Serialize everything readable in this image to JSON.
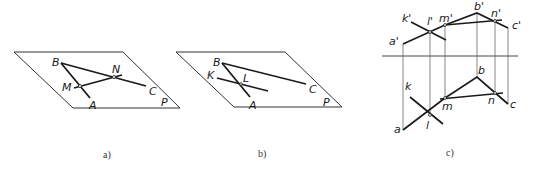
{
  "figures": {
    "a": {
      "caption": "a)",
      "plane_label": "P",
      "points": {
        "B": "B",
        "A": "A",
        "C": "C",
        "M": "M",
        "N": "N"
      }
    },
    "b": {
      "caption": "b)",
      "plane_label": "P",
      "points": {
        "B": "B",
        "A": "A",
        "C": "C",
        "K": "K",
        "L": "L"
      }
    },
    "c": {
      "caption": "c)",
      "front_view": {
        "a": "a'",
        "k": "k'",
        "l": "l'",
        "m": "m'",
        "b": "b'",
        "n": "n'",
        "c": "c'"
      },
      "top_view": {
        "a": "a",
        "k": "k",
        "l": "l",
        "m": "m",
        "b": "b",
        "n": "n",
        "c": "c"
      }
    }
  },
  "colors": {
    "line": "#1a1a1a",
    "thin": "#444444"
  }
}
